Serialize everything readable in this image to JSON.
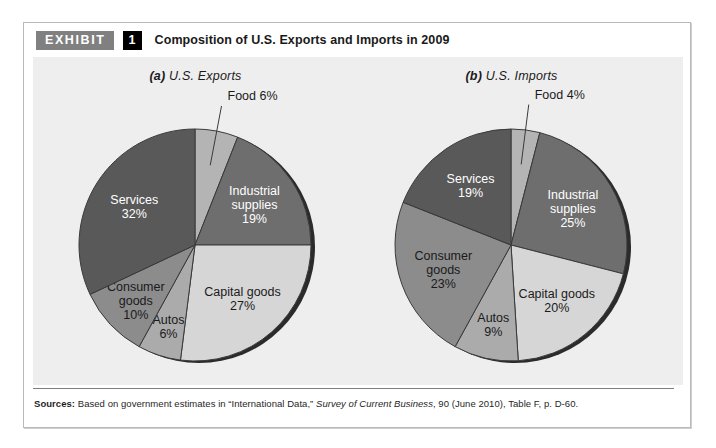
{
  "exhibit": {
    "tag": "EXHIBIT",
    "number": "1",
    "title": "Composition of U.S. Exports and Imports in 2009"
  },
  "sources": {
    "label": "Sources:",
    "text_before": " Based on government estimates in “International Data,” ",
    "italic_part": "Survey of Current Business",
    "text_after": ", 90 (June 2010), Table F, p. D-60."
  },
  "colors": {
    "panel_background": "#eeeeee",
    "food": "#b4b4b4",
    "industrial_supplies": "#6e6e6e",
    "capital_goods": "#d6d6d6",
    "autos": "#ababab",
    "consumer_goods": "#8c8c8c",
    "services": "#595959",
    "rim": "#2b2b2b",
    "slice_outline": "#3a3a3a"
  },
  "chart_data": [
    {
      "type": "pie",
      "id": "us-exports",
      "title": "(a) U.S. Exports",
      "title_prefix": "(a)",
      "title_rest": " U.S. Exports",
      "unit": "percent",
      "start_angle_deg": 0,
      "direction": "clockwise",
      "categories": [
        "Food",
        "Industrial supplies",
        "Capital goods",
        "Autos",
        "Consumer goods",
        "Services"
      ],
      "values": [
        6,
        19,
        27,
        6,
        10,
        32
      ],
      "slices": [
        {
          "label": "Food",
          "value": 6,
          "value_text": "6%",
          "label_text": "Food 6%",
          "color": "#b4b4b4",
          "text_color": "#1a1a1a",
          "callout": true,
          "label_lines": [
            "Food 6%"
          ]
        },
        {
          "label": "Industrial supplies",
          "value": 19,
          "value_text": "19%",
          "color": "#6e6e6e",
          "text_color": "#ffffff",
          "callout": false,
          "label_lines": [
            "Industrial",
            "supplies",
            "19%"
          ]
        },
        {
          "label": "Capital goods",
          "value": 27,
          "value_text": "27%",
          "color": "#d6d6d6",
          "text_color": "#1a1a1a",
          "callout": false,
          "label_lines": [
            "Capital goods",
            "27%"
          ]
        },
        {
          "label": "Autos",
          "value": 6,
          "value_text": "6%",
          "color": "#ababab",
          "text_color": "#1a1a1a",
          "callout": false,
          "label_lines": [
            "Autos",
            "6%"
          ]
        },
        {
          "label": "Consumer goods",
          "value": 10,
          "value_text": "10%",
          "color": "#8c8c8c",
          "text_color": "#1a1a1a",
          "callout": false,
          "label_lines": [
            "Consumer",
            "goods",
            "10%"
          ]
        },
        {
          "label": "Services",
          "value": 32,
          "value_text": "32%",
          "color": "#595959",
          "text_color": "#ffffff",
          "callout": false,
          "label_lines": [
            "Services",
            "32%"
          ]
        }
      ]
    },
    {
      "type": "pie",
      "id": "us-imports",
      "title": "(b) U.S. Imports",
      "title_prefix": "(b)",
      "title_rest": " U.S. Imports",
      "unit": "percent",
      "start_angle_deg": 0,
      "direction": "clockwise",
      "categories": [
        "Food",
        "Industrial supplies",
        "Capital goods",
        "Autos",
        "Consumer goods",
        "Services"
      ],
      "values": [
        4,
        25,
        20,
        9,
        23,
        19
      ],
      "slices": [
        {
          "label": "Food",
          "value": 4,
          "value_text": "4%",
          "label_text": "Food 4%",
          "color": "#b4b4b4",
          "text_color": "#1a1a1a",
          "callout": true,
          "label_lines": [
            "Food 4%"
          ]
        },
        {
          "label": "Industrial supplies",
          "value": 25,
          "value_text": "25%",
          "color": "#6e6e6e",
          "text_color": "#ffffff",
          "callout": false,
          "label_lines": [
            "Industrial",
            "supplies",
            "25%"
          ]
        },
        {
          "label": "Capital goods",
          "value": 20,
          "value_text": "20%",
          "color": "#d6d6d6",
          "text_color": "#1a1a1a",
          "callout": false,
          "label_lines": [
            "Capital goods",
            "20%"
          ]
        },
        {
          "label": "Autos",
          "value": 9,
          "value_text": "9%",
          "color": "#ababab",
          "text_color": "#1a1a1a",
          "callout": false,
          "label_lines": [
            "Autos",
            "9%"
          ]
        },
        {
          "label": "Consumer goods",
          "value": 23,
          "value_text": "23%",
          "color": "#8c8c8c",
          "text_color": "#1a1a1a",
          "callout": false,
          "label_lines": [
            "Consumer",
            "goods",
            "23%"
          ]
        },
        {
          "label": "Services",
          "value": 19,
          "value_text": "19%",
          "color": "#595959",
          "text_color": "#ffffff",
          "callout": false,
          "label_lines": [
            "Services",
            "19%"
          ]
        }
      ]
    }
  ]
}
